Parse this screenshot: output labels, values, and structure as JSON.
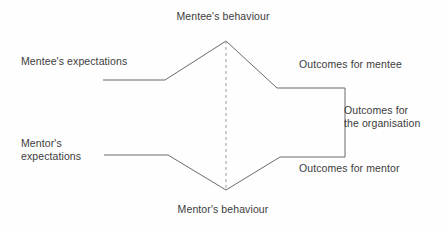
{
  "diagram": {
    "type": "bow-tie-process-diagram",
    "background_color": "#fefefe",
    "line_color": "#6b6b6b",
    "dashed_line_color": "#9a9a9a",
    "text_color": "#3c3c3c",
    "labels": {
      "top": "Mentee's behaviour",
      "bottom": "Mentor's behaviour",
      "left_upper": "Mentee's expectations",
      "left_lower": "Mentor's\nexpectations",
      "right_upper": "Outcomes for mentee",
      "right_middle": "Outcomes for\nthe organisation",
      "right_lower": "Outcomes for mentor"
    },
    "geometry": {
      "upper_left_line": [
        [
          103,
          80
        ],
        [
          165,
          80
        ],
        [
          226,
          41
        ]
      ],
      "lower_left_line": [
        [
          104,
          155
        ],
        [
          168,
          155
        ],
        [
          226,
          190
        ]
      ],
      "upper_right_line": [
        [
          226,
          41
        ],
        [
          277,
          88
        ],
        [
          345,
          88
        ]
      ],
      "lower_right_line": [
        [
          226,
          190
        ],
        [
          280,
          157
        ],
        [
          345,
          157
        ]
      ],
      "right_vertical_line": [
        [
          345,
          88
        ],
        [
          345,
          157
        ]
      ],
      "centre_dashed_line": [
        [
          226,
          41
        ],
        [
          226,
          190
        ]
      ]
    }
  }
}
